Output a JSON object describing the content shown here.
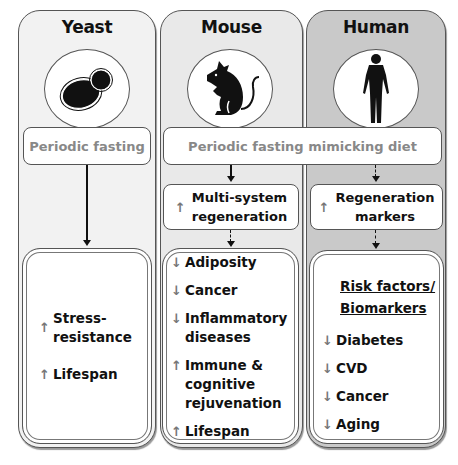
{
  "columns": {
    "yeast": {
      "title": "Yeast",
      "icon": "yeast-cell-icon",
      "intervention": "Periodic fasting",
      "outcomes": [
        {
          "direction": "up",
          "label": "Stress-resistance",
          "lines": [
            "Stress-",
            "resistance"
          ]
        },
        {
          "direction": "up",
          "label": "Lifespan",
          "lines": [
            "Lifespan"
          ]
        }
      ]
    },
    "mouse": {
      "title": "Mouse",
      "icon": "mouse-icon",
      "regeneration": {
        "direction": "up",
        "lines": [
          "Multi-system",
          "regeneration"
        ]
      },
      "outcomes": [
        {
          "direction": "down",
          "lines": [
            "Adiposity"
          ]
        },
        {
          "direction": "down",
          "lines": [
            "Cancer"
          ]
        },
        {
          "direction": "down",
          "lines": [
            "Inflammatory",
            "diseases"
          ]
        },
        {
          "direction": "up",
          "lines": [
            "Immune &",
            "cognitive",
            "rejuvenation"
          ]
        },
        {
          "direction": "up",
          "lines": [
            "Lifespan"
          ]
        }
      ]
    },
    "human": {
      "title": "Human",
      "icon": "human-figure-icon",
      "regeneration": {
        "direction": "up",
        "lines": [
          "Regeneration",
          "markers"
        ]
      },
      "heading": [
        "Risk factors/",
        "Biomarkers"
      ],
      "outcomes": [
        {
          "direction": "down",
          "lines": [
            "Diabetes"
          ]
        },
        {
          "direction": "down",
          "lines": [
            "CVD"
          ]
        },
        {
          "direction": "down",
          "lines": [
            "Cancer"
          ]
        },
        {
          "direction": "down",
          "lines": [
            "Aging"
          ]
        }
      ]
    }
  },
  "shared_intervention": "Periodic fasting mimicking diet",
  "glyphs": {
    "up": "↑",
    "down": "↓"
  },
  "colors": {
    "yeast_bg": "#f2f2f2",
    "mouse_bg": "#e9e9e9",
    "human_bg": "#c9c9c9",
    "intervention_text": "#888888",
    "arrow": "#777777"
  }
}
